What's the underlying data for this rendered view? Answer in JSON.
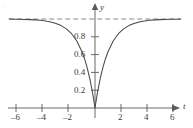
{
  "figure": {
    "background_color": "#ffffff",
    "curve_color": "#4a4a4a",
    "axis_color": "#5a5a5a",
    "asymptote_color": "#8a8a8a",
    "text_color": "#3b3b3b",
    "corner_mark": "."
  },
  "chart_data": {
    "type": "line",
    "title": "",
    "subtitle": "",
    "xlabel": "t",
    "ylabel": "y",
    "xlim": [
      -7.0,
      7.2
    ],
    "ylim": [
      -0.12,
      1.22
    ],
    "grid": false,
    "legend": null,
    "x_ticks": [
      -6,
      -4,
      -2,
      2,
      4,
      6
    ],
    "x_tick_labels": [
      "–6",
      "–4",
      "–2",
      "2",
      "4",
      "6"
    ],
    "y_ticks": [
      0.2,
      0.4,
      0.6,
      0.8
    ],
    "y_tick_labels": [
      "0.2",
      "0.4",
      "0.6",
      "0.8"
    ],
    "annotations": [
      {
        "name": "horizontal-asymptote",
        "kind": "dashed-line",
        "y": 1.0,
        "x_start": -6.6,
        "x_end": 6.6,
        "label": ""
      }
    ],
    "series": [
      {
        "name": "y = 1 - e^(-|t|)",
        "style": "solid",
        "x": [
          -6.6,
          -6.2,
          -5.8,
          -5.4,
          -5.0,
          -4.6,
          -4.2,
          -3.8,
          -3.4,
          -3.0,
          -2.6,
          -2.2,
          -1.8,
          -1.4,
          -1.0,
          -0.8,
          -0.6,
          -0.4,
          -0.2,
          -0.1,
          0.0,
          0.1,
          0.2,
          0.4,
          0.6,
          0.8,
          1.0,
          1.4,
          1.8,
          2.2,
          2.6,
          3.0,
          3.4,
          3.8,
          4.2,
          4.6,
          5.0,
          5.4,
          5.8,
          6.2,
          6.6
        ],
        "y": [
          0.999,
          0.998,
          0.997,
          0.995,
          0.993,
          0.99,
          0.985,
          0.978,
          0.967,
          0.95,
          0.926,
          0.889,
          0.835,
          0.753,
          0.632,
          0.551,
          0.451,
          0.33,
          0.181,
          0.095,
          0.0,
          0.095,
          0.181,
          0.33,
          0.451,
          0.551,
          0.632,
          0.753,
          0.835,
          0.889,
          0.926,
          0.95,
          0.967,
          0.978,
          0.985,
          0.99,
          0.993,
          0.995,
          0.997,
          0.998,
          0.999
        ]
      }
    ]
  }
}
